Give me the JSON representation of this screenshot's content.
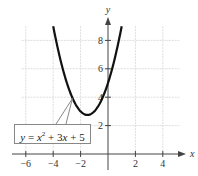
{
  "chart_data": {
    "type": "line",
    "title": "",
    "xlabel": "x",
    "ylabel": "y",
    "xlim": [
      -7,
      5
    ],
    "ylim": [
      0,
      9
    ],
    "x_ticks": [
      -6,
      -4,
      -2,
      2,
      4
    ],
    "x_tick_labels": [
      "−6",
      "−4",
      "−2",
      "2",
      "4"
    ],
    "y_ticks": [
      2,
      4,
      6,
      8
    ],
    "y_tick_labels": [
      "2",
      "4",
      "6",
      "8"
    ],
    "grid": true,
    "series": [
      {
        "name": "y = x^2 + 3x + 5",
        "equation": "y = x^2 + 3x + 5",
        "x": [
          -4,
          -3.5,
          -3,
          -2.5,
          -2,
          -1.5,
          -1,
          -0.5,
          0,
          0.5,
          1
        ],
        "values": [
          9,
          6.75,
          5,
          3.75,
          3,
          2.75,
          3,
          3.75,
          5,
          6.75,
          9
        ]
      }
    ],
    "annotations": [
      {
        "text": "y = x² + 3x + 5",
        "points_to": [
          -2.6,
          3.9
        ]
      }
    ]
  },
  "labels": {
    "x_axis": "x",
    "y_axis": "y",
    "eq_y": "y",
    "eq_eq": " = ",
    "eq_x": "x",
    "eq_exp": "2",
    "eq_rest": " + 3",
    "eq_x2": "x",
    "eq_tail": " + 5"
  }
}
